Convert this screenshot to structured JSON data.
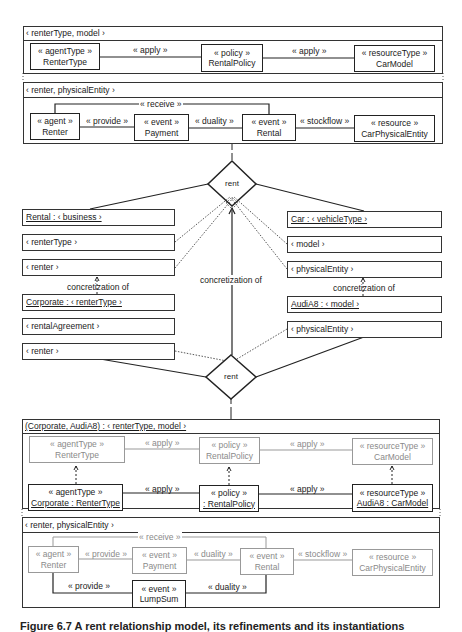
{
  "frames": {
    "type_level": {
      "header": "‹ renterType, model ›",
      "boxes": [
        {
          "stereotype": "« agentType »",
          "name": "RenterType"
        },
        {
          "stereotype": "« policy »",
          "name": "RentalPolicy"
        },
        {
          "stereotype": "« resourceType »",
          "name": "CarModel"
        }
      ],
      "links": [
        "« apply »",
        "« apply »"
      ]
    },
    "instance_level": {
      "header": "‹ renter, physicalEntity ›",
      "boxes": [
        {
          "stereotype": "« agent »",
          "name": "Renter"
        },
        {
          "stereotype": "« event »",
          "name": "Payment"
        },
        {
          "stereotype": "« event »",
          "name": "Rental"
        },
        {
          "stereotype": "« resource »",
          "name": "CarPhysicalEntity"
        }
      ],
      "links": [
        "« provide »",
        "« duality »",
        "« stockflow »",
        "« receive »"
      ]
    }
  },
  "middle": {
    "diamond_top": "rent",
    "diamond_bottom": "rent",
    "left_top": {
      "title": "Rental : ‹ business ›",
      "rows": [
        "‹ renterType ›",
        "‹ renter ›"
      ]
    },
    "right_top": {
      "title": "Car : ‹ vehicleType ›",
      "rows": [
        "‹ model ›",
        "‹ physicalEntity ›"
      ]
    },
    "left_bottom": {
      "title": "Corporate : ‹ renterType ›",
      "rows": [
        "‹ rentalAgreement ›",
        "‹ renter ›"
      ]
    },
    "right_bottom": {
      "title": "AudiA8 : ‹ model ›",
      "rows": [
        "‹ physicalEntity ›"
      ]
    },
    "concretization_left": "concretization of",
    "concretization_center": "concretization of",
    "concretization_right": "concretization of"
  },
  "bottom": {
    "type_level": {
      "header": "(Corporate, AudiA8) : ‹ renterType, model ›",
      "grey_boxes": [
        {
          "stereotype": "« agentType »",
          "name": "RenterType"
        },
        {
          "stereotype": "« policy »",
          "name": "RentalPolicy"
        },
        {
          "stereotype": "« resourceType »",
          "name": "CarModel"
        }
      ],
      "grey_links": [
        "« apply »",
        "« apply »"
      ],
      "boxes": [
        {
          "stereotype": "« agentType »",
          "name": "Corporate : RenterType"
        },
        {
          "stereotype": "« policy »",
          "name": ": RentalPolicy"
        },
        {
          "stereotype": "« resourceType »",
          "name": "AudiA8 : CarModel"
        }
      ],
      "links": [
        "« apply »",
        "« apply »"
      ]
    },
    "instance_level": {
      "header": "‹ renter, physicalEntity ›",
      "grey_boxes": [
        {
          "stereotype": "« agent »",
          "name": "Renter"
        },
        {
          "stereotype": "« event »",
          "name": "Payment"
        },
        {
          "stereotype": "« event »",
          "name": "Rental"
        },
        {
          "stereotype": "« resource »",
          "name": "CarPhysicalEntity"
        }
      ],
      "grey_links": [
        "« provide »",
        "« duality »",
        "« stockflow »",
        "« receive »"
      ],
      "new_box": {
        "stereotype": "« event »",
        "name": "LumpSum"
      },
      "links": [
        "« provide »",
        "« duality »"
      ]
    }
  },
  "caption": "Figure 6.7 A rent relationship model, its refinements and its instantiations"
}
